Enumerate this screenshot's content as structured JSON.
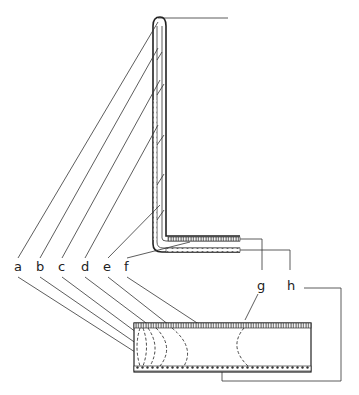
{
  "labels": {
    "a": "a",
    "b": "b",
    "c": "c",
    "d": "d",
    "e": "e",
    "f": "f",
    "g": "g",
    "h": "h"
  },
  "colors": {
    "line": "#333333",
    "background": "#ffffff"
  }
}
